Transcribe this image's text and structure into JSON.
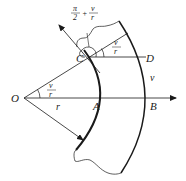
{
  "diagram": {
    "type": "geometry",
    "colors": {
      "stroke": "#1a1a1a",
      "background": "#ffffff"
    },
    "points": {
      "O": {
        "label": "O",
        "x": 24,
        "y": 98
      },
      "A": {
        "label": "A",
        "x": 102,
        "y": 98
      },
      "B": {
        "label": "B",
        "x": 149,
        "y": 98
      },
      "C": {
        "label": "C",
        "x": 88,
        "y": 57
      },
      "D": {
        "label": "D",
        "x": 146,
        "y": 57
      }
    },
    "labels": {
      "radius": "r",
      "velocity": "v",
      "angle_numerator": "v",
      "angle_denominator": "r",
      "angle_at_D_numerator": "v",
      "angle_at_D_denominator": "r",
      "top_angle_pi": "π",
      "top_angle_two": "2",
      "top_angle_plus": "+",
      "top_angle_numerator": "v",
      "top_angle_denominator": "r"
    }
  }
}
